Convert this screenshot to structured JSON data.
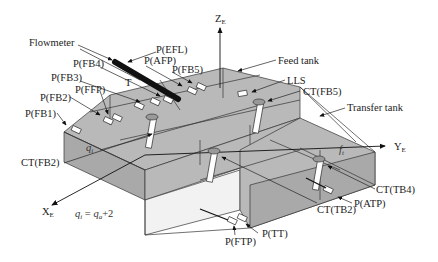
{
  "figure": {
    "type": "3d-tank-schematic",
    "axes": {
      "x": {
        "label": "X",
        "subscript": "E"
      },
      "y": {
        "label": "Y",
        "subscript": "E"
      },
      "z": {
        "label": "Z",
        "subscript": "E"
      }
    },
    "components": {
      "flowmeter": "Flowmeter",
      "feed_tank": "Feed tank",
      "transfer_tank": "Transfer tank",
      "lls": "LLS",
      "t": "T"
    },
    "sensors_left": [
      {
        "id": "efl",
        "label": "P(EFL)"
      },
      {
        "id": "afp",
        "label": "P(AFP)"
      },
      {
        "id": "fb4",
        "label": "P(FB4)"
      },
      {
        "id": "fb5",
        "label": "P(FB5)"
      },
      {
        "id": "fb3",
        "label": "P(FB3)"
      },
      {
        "id": "ffp",
        "label": "P(FFP)"
      },
      {
        "id": "fb2",
        "label": "P(FB2)"
      },
      {
        "id": "fb1",
        "label": "P(FB1)"
      }
    ],
    "thermocouples": [
      {
        "id": "ct_fb5",
        "label": "CT(FB5)"
      },
      {
        "id": "ct_fb2",
        "label": "CT(FB2)"
      },
      {
        "id": "ct_tb4",
        "label": "CT(TB4)"
      },
      {
        "id": "ct_tb2",
        "label": "CT(TB2)"
      }
    ],
    "sensors_bottom": [
      {
        "id": "atp",
        "label": "P(ATP)"
      },
      {
        "id": "tt",
        "label": "P(TT)"
      },
      {
        "id": "ftp",
        "label": "P(FTP)"
      }
    ],
    "angles": {
      "qi": {
        "symbol": "q",
        "subscript": "i"
      },
      "ft": {
        "symbol": "f",
        "subscript": "t"
      }
    },
    "equation": {
      "lhs": "q",
      "lhs_sub": "i",
      "eq": " = ",
      "rhs": "q",
      "rhs_sub": "a",
      "rhs_tail": "+2"
    },
    "colors": {
      "tank_face": "#b9b9b9",
      "tank_face_dark": "#a9a9a9",
      "outline": "#333333",
      "flowmeter": "#111111"
    }
  }
}
